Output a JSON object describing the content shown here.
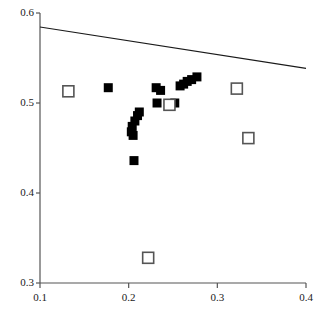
{
  "chart_data": {
    "type": "scatter",
    "title": "",
    "subtitle": "",
    "xlabel": "",
    "ylabel": "",
    "xlim": [
      0.1,
      0.4
    ],
    "ylim": [
      0.3,
      0.6
    ],
    "xticks": [
      0.1,
      0.2,
      0.3,
      0.4
    ],
    "yticks": [
      0.3,
      0.4,
      0.5,
      0.6
    ],
    "xtick_labels": [
      "0.1",
      "0.2",
      "0.3",
      "0.4"
    ],
    "ytick_labels": [
      "0.3",
      "0.4",
      "0.5",
      "0.6"
    ],
    "grid": false,
    "legend": null,
    "marker_colors": {
      "filled": "#000000",
      "open_fill": "#ffffff",
      "open_edge": "#555555",
      "axis": "#555555",
      "line": "#1a1a1a"
    },
    "series": [
      {
        "name": "filled-squares",
        "marker": "square-filled",
        "points": [
          [
            0.177,
            0.517
          ],
          [
            0.207,
            0.48
          ],
          [
            0.204,
            0.474
          ],
          [
            0.203,
            0.468
          ],
          [
            0.205,
            0.464
          ],
          [
            0.21,
            0.486
          ],
          [
            0.212,
            0.49
          ],
          [
            0.206,
            0.436
          ],
          [
            0.231,
            0.517
          ],
          [
            0.236,
            0.514
          ],
          [
            0.232,
            0.5
          ],
          [
            0.252,
            0.5
          ],
          [
            0.258,
            0.519
          ],
          [
            0.262,
            0.521
          ],
          [
            0.266,
            0.524
          ],
          [
            0.271,
            0.526
          ],
          [
            0.277,
            0.529
          ]
        ]
      },
      {
        "name": "open-squares",
        "marker": "square-open",
        "points": [
          [
            0.132,
            0.513
          ],
          [
            0.246,
            0.498
          ],
          [
            0.322,
            0.516
          ],
          [
            0.335,
            0.461
          ],
          [
            0.222,
            0.328
          ]
        ]
      }
    ],
    "lines": [
      {
        "name": "boundary-line",
        "x": [
          0.1,
          0.4
        ],
        "y": [
          0.5845,
          0.5385
        ]
      }
    ]
  }
}
